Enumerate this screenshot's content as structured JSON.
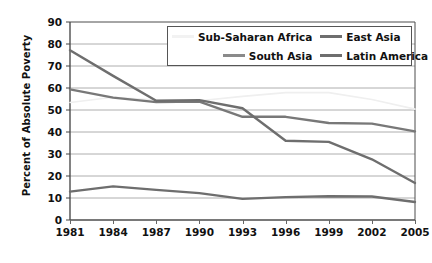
{
  "chart_data": {
    "type": "line",
    "title": "",
    "xlabel": "",
    "ylabel": "Percent of Absolute Poverty",
    "x": [
      1981,
      1984,
      1987,
      1990,
      1993,
      1996,
      1999,
      2002,
      2005
    ],
    "xtick_labels": [
      "1981",
      "1984",
      "1987",
      "1990",
      "1993",
      "1996",
      "1999",
      "2002",
      "2005"
    ],
    "ytick_labels": [
      "0",
      "10",
      "20",
      "30",
      "40",
      "50",
      "60",
      "70",
      "80",
      "90"
    ],
    "ylim": [
      0,
      90
    ],
    "ytick_step": 10,
    "grid": "horizontal",
    "legend_position": "top-center-inside",
    "series": [
      {
        "name": "Sub-Saharan Africa",
        "color": "#efefef",
        "values": [
          53.4,
          55.8,
          54.5,
          54.2,
          56.2,
          57.9,
          57.9,
          54.8,
          50.4
        ]
      },
      {
        "name": "East Asia",
        "color": "#6e6e6e",
        "values": [
          77.2,
          65.5,
          54.2,
          54.5,
          50.8,
          36.0,
          35.5,
          27.6,
          16.8
        ]
      },
      {
        "name": "South Asia",
        "color": "#787878",
        "values": [
          59.4,
          55.6,
          53.6,
          53.8,
          46.9,
          46.9,
          44.1,
          43.8,
          40.3
        ]
      },
      {
        "name": "Latin America",
        "color": "#6e6e6e",
        "values": [
          12.9,
          15.3,
          13.7,
          12.2,
          9.6,
          10.4,
          10.8,
          10.7,
          8.2
        ]
      }
    ]
  },
  "legend": {
    "entries": [
      {
        "label": "Sub-Saharan Africa",
        "color": "#f2f2f2"
      },
      {
        "label": "East Asia",
        "color": "#6e6e6e"
      },
      {
        "label": "South Asia",
        "color": "#8a8a8a"
      },
      {
        "label": "Latin America",
        "color": "#6e6e6e"
      }
    ]
  },
  "axes": {
    "y_title": "Percent of Absolute Poverty"
  }
}
